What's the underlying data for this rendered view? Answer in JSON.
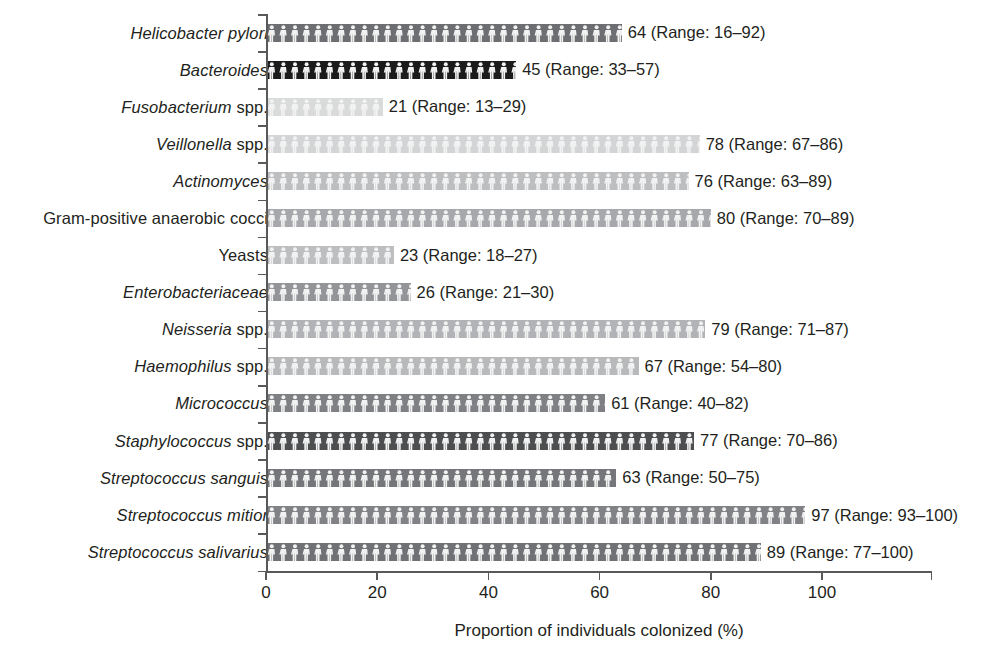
{
  "chart_data": {
    "type": "bar",
    "orientation": "horizontal",
    "title": "",
    "xlabel": "Proportion of individuals colonized (%)",
    "ylabel": "",
    "xlim": [
      0,
      100
    ],
    "xticks": [
      0,
      20,
      40,
      60,
      80,
      100
    ],
    "xtick_labels": [
      "0",
      "20",
      "40",
      "60",
      "80",
      "100"
    ],
    "grid": false,
    "legend": null,
    "bar_fill_pattern": "human-figure-pictogram",
    "categories": [
      "Helicobacter pylori",
      "Bacteroides",
      "Fusobacterium spp.",
      "Veillonella spp.",
      "Actinomyces",
      "Gram-positive anaerobic cocci",
      "Yeasts",
      "Enterobacteriaceae",
      "Neisseria spp.",
      "Haemophilus spp.",
      "Micrococcus",
      "Staphylococcus spp.",
      "Streptococcus sanguis",
      "Streptococcus mitior",
      "Streptococcus salivarius"
    ],
    "values": [
      64,
      45,
      21,
      78,
      76,
      80,
      23,
      26,
      79,
      67,
      61,
      77,
      63,
      97,
      89
    ],
    "ranges": [
      [
        16,
        92
      ],
      [
        33,
        57
      ],
      [
        13,
        29
      ],
      [
        67,
        86
      ],
      [
        63,
        89
      ],
      [
        70,
        89
      ],
      [
        18,
        27
      ],
      [
        21,
        30
      ],
      [
        71,
        87
      ],
      [
        54,
        80
      ],
      [
        40,
        82
      ],
      [
        70,
        86
      ],
      [
        50,
        75
      ],
      [
        93,
        100
      ],
      [
        77,
        100
      ]
    ],
    "bars": [
      {
        "label_italic": "Helicobacter pylori",
        "label_roman": "",
        "value": 64,
        "range_low": 16,
        "range_high": 92,
        "value_label": "64 (Range: 16–92)",
        "color": "#6d6e71"
      },
      {
        "label_italic": "Bacteroides",
        "label_roman": "",
        "value": 45,
        "range_low": 33,
        "range_high": 57,
        "value_label": "45 (Range: 33–57)",
        "color": "#1b1b1b"
      },
      {
        "label_italic": "Fusobacterium",
        "label_roman": " spp.",
        "value": 21,
        "range_low": 13,
        "range_high": 29,
        "value_label": "21 (Range: 13–29)",
        "color": "#d9dada"
      },
      {
        "label_italic": "Veillonella",
        "label_roman": " spp.",
        "value": 78,
        "range_low": 67,
        "range_high": 86,
        "value_label": "78 (Range: 67–86)",
        "color": "#d3d4d5"
      },
      {
        "label_italic": "Actinomyces",
        "label_roman": "",
        "value": 76,
        "range_low": 63,
        "range_high": 89,
        "value_label": "76 (Range: 63–89)",
        "color": "#bcbec0"
      },
      {
        "label_italic": "",
        "label_roman": "Gram-positive anaerobic cocci",
        "value": 80,
        "range_low": 70,
        "range_high": 89,
        "value_label": "80 (Range: 70–89)",
        "color": "#a6a8ab"
      },
      {
        "label_italic": "",
        "label_roman": "Yeasts",
        "value": 23,
        "range_low": 18,
        "range_high": 27,
        "value_label": "23 (Range: 18–27)",
        "color": "#bcbec0"
      },
      {
        "label_italic": "Enterobacteriaceae",
        "label_roman": "",
        "value": 26,
        "range_low": 21,
        "range_high": 30,
        "value_label": "26 (Range: 21–30)",
        "color": "#929497"
      },
      {
        "label_italic": "Neisseria",
        "label_roman": " spp.",
        "value": 79,
        "range_low": 71,
        "range_high": 87,
        "value_label": "79 (Range: 71–87)",
        "color": "#b1b3b6"
      },
      {
        "label_italic": "Haemophilus",
        "label_roman": " spp.",
        "value": 67,
        "range_low": 54,
        "range_high": 80,
        "value_label": "67 (Range: 54–80)",
        "color": "#b7b9bb"
      },
      {
        "label_italic": "Micrococcus",
        "label_roman": "",
        "value": 61,
        "range_low": 40,
        "range_high": 82,
        "value_label": "61 (Range: 40–82)",
        "color": "#7e8083"
      },
      {
        "label_italic": "Staphylococcus",
        "label_roman": " spp.",
        "value": 77,
        "range_low": 70,
        "range_high": 86,
        "value_label": "77 (Range: 70–86)",
        "color": "#4d4e50"
      },
      {
        "label_italic": "Streptococcus sanguis",
        "label_roman": "",
        "value": 63,
        "range_low": 50,
        "range_high": 75,
        "value_label": "63 (Range: 50–75)",
        "color": "#757679"
      },
      {
        "label_italic": "Streptococcus mitior",
        "label_roman": "",
        "value": 97,
        "range_low": 93,
        "range_high": 100,
        "value_label": "97 (Range: 93–100)",
        "color": "#808285"
      },
      {
        "label_italic": "Streptococcus salivarius",
        "label_roman": "",
        "value": 89,
        "range_low": 77,
        "range_high": 100,
        "value_label": "89 (Range: 77–100)",
        "color": "#6f7174"
      }
    ]
  },
  "axis": {
    "x_title": "Proportion of individuals colonized (%)",
    "x_tick_labels": [
      "0",
      "20",
      "40",
      "60",
      "80",
      "100"
    ],
    "axis_color": "#58595b"
  }
}
